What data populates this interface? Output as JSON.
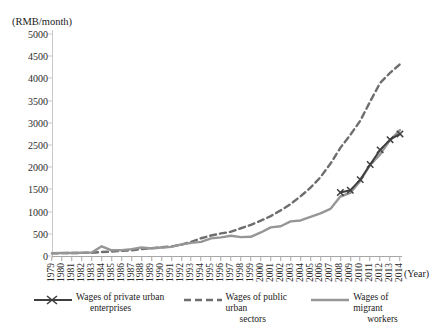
{
  "chart_data": {
    "type": "line",
    "title": "",
    "subtitle": "",
    "xlabel": "(Year)",
    "ylabel": "(RMB/month)",
    "ylim": [
      0,
      5000
    ],
    "yticks": [
      0,
      500,
      1000,
      1500,
      2000,
      2500,
      3000,
      3500,
      4000,
      4500,
      5000
    ],
    "ytick_labels": [
      "0",
      "500",
      "1000",
      "1500",
      "2000",
      "2500",
      "3000",
      "3500",
      "4000",
      "4500",
      "5000"
    ],
    "grid": false,
    "legend_position": "bottom",
    "categories": [
      "1979",
      "1980",
      "1981",
      "1982",
      "1983",
      "1984",
      "1985",
      "1986",
      "1987",
      "1988",
      "1989",
      "1990",
      "1991",
      "1992",
      "1993",
      "1994",
      "1995",
      "1996",
      "1997",
      "1998",
      "1999",
      "2000",
      "2001",
      "2002",
      "2003",
      "2004",
      "2005",
      "2006",
      "2007",
      "2008",
      "2009",
      "2010",
      "2011",
      "2012",
      "2013",
      "2014"
    ],
    "series": [
      {
        "name": "Wages of private urban enterprises",
        "color": "#3f3f3f",
        "style": "solid-marker",
        "marker": "x",
        "values": [
          null,
          null,
          null,
          null,
          null,
          null,
          null,
          null,
          null,
          null,
          null,
          null,
          null,
          null,
          null,
          null,
          null,
          null,
          null,
          null,
          null,
          null,
          null,
          null,
          null,
          null,
          null,
          null,
          null,
          1430,
          1480,
          1720,
          2060,
          2390,
          2620,
          2750
        ]
      },
      {
        "name": "Wages of public urban sectors",
        "color": "#6e6e6e",
        "style": "dashed",
        "marker": "none",
        "values": [
          60,
          65,
          67,
          70,
          74,
          89,
          101,
          117,
          130,
          156,
          177,
          197,
          216,
          254,
          317,
          400,
          462,
          508,
          547,
          625,
          702,
          795,
          898,
          1028,
          1171,
          1344,
          1539,
          1775,
          2078,
          2435,
          2728,
          3045,
          3480,
          3897,
          4125,
          4320
        ]
      },
      {
        "name": "Wages of migrant workers",
        "color": "#969696",
        "style": "solid",
        "marker": "none",
        "values": [
          62,
          66,
          68,
          72,
          78,
          218,
          128,
          133,
          155,
          190,
          168,
          190,
          205,
          262,
          296,
          318,
          398,
          420,
          455,
          425,
          432,
          530,
          645,
          670,
          780,
          800,
          880,
          960,
          1060,
          1340,
          1420,
          1690,
          2050,
          2290,
          2610,
          2835
        ]
      }
    ]
  },
  "axis": {
    "y_unit_label": "(RMB/month)",
    "x_axis_title": "(Year)"
  },
  "legend": {
    "items": [
      {
        "label_line1": "Wages of private urban",
        "label_line2": "enterprises",
        "swatch": "solid-line-with-x-marker",
        "color": "#3f3f3f"
      },
      {
        "label_line1": "Wages of public urban",
        "label_line2": "sectors",
        "swatch": "dashed-line",
        "color": "#6e6e6e"
      },
      {
        "label_line1": "Wages of migrant",
        "label_line2": "workers",
        "swatch": "solid-line",
        "color": "#969696"
      }
    ]
  }
}
